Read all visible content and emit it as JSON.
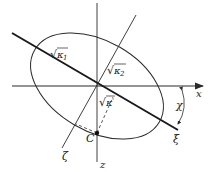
{
  "diagram": {
    "type": "ellipse-axes",
    "colors": {
      "stroke": "#2a2a2a",
      "background": "#ffffff"
    },
    "axes": {
      "x": {
        "label": "x"
      },
      "z": {
        "label": "z"
      },
      "xi": {
        "label": "ξ"
      },
      "zeta": {
        "label": "ζ"
      }
    },
    "labels": {
      "kappa1": {
        "radical": "√",
        "symbol": "κ",
        "sub": "1"
      },
      "kappa2": {
        "radical": "√",
        "symbol": "κ",
        "sub": "2"
      },
      "kappa_prime": {
        "radical": "√",
        "symbol": "κ",
        "sub": "'"
      },
      "point_c": "C",
      "angle": "χ"
    }
  }
}
